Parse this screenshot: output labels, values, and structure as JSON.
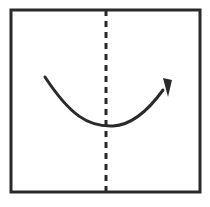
{
  "diagram": {
    "type": "origami-fold-instruction",
    "background": "#ffffff",
    "stroke_color": "#2a2a2a",
    "paper": {
      "x": 11,
      "y": 10,
      "width": 189,
      "height": 182,
      "stroke_width": 3
    },
    "fold_line": {
      "style": "valley-dashed",
      "x": 106,
      "y1": 10,
      "y2": 192,
      "dash": "6 5",
      "stroke_width": 3
    },
    "fold_arrow": {
      "direction": "left-to-right",
      "path": "M45,77 C70,115 88,127 113,126 C133,125 150,108 163,90",
      "stroke_width": 3,
      "head": "163,78 172,80 168,97"
    }
  }
}
